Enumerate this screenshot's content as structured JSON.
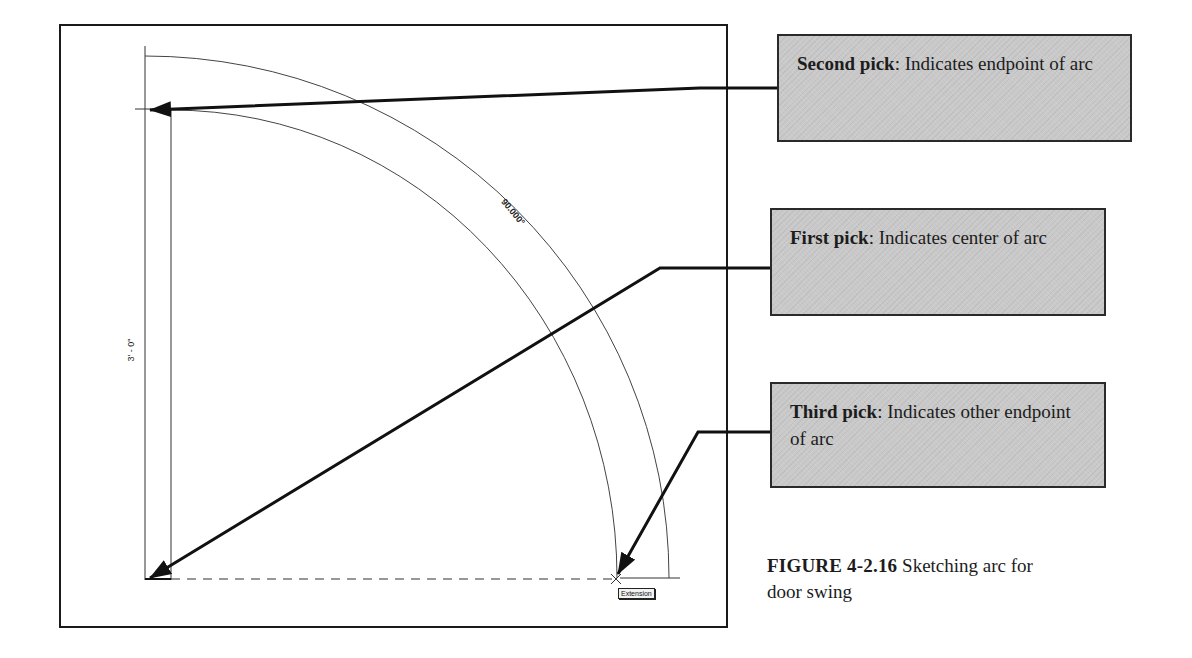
{
  "figure": {
    "number": "FIGURE 4-2.16",
    "caption": "Sketching arc for door swing"
  },
  "drawing": {
    "dimension_label": "3' - 0\"",
    "angle_label": "90.000°",
    "snap_tooltip": "Extension"
  },
  "callouts": [
    {
      "id": "second-pick",
      "title": "Second pick",
      "text": ": Indicates endpoint of arc"
    },
    {
      "id": "first-pick",
      "title": "First pick",
      "text": ": Indicates center of arc"
    },
    {
      "id": "third-pick",
      "title": "Third pick",
      "text": ": Indicates other endpoint of arc"
    }
  ],
  "colors": {
    "callout_fill": "#c9c9c9",
    "line": "#1a1a1a"
  }
}
